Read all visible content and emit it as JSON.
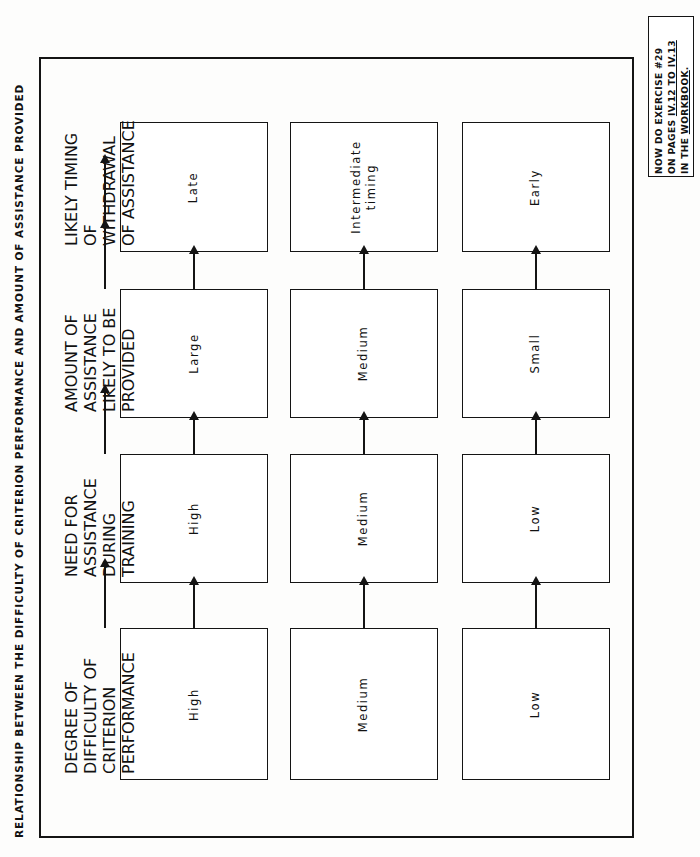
{
  "caption": {
    "text": "RELATIONSHIP BETWEEN THE DIFFICULTY OF CRITERION PERFORMANCE AND AMOUNT OF ASSISTANCE PROVIDED"
  },
  "note": {
    "line1": "NOW DO EXERCISE #29",
    "line2_plain": "ON PAGES ",
    "line2_underlined": "IV.12 TO IV.13",
    "line3_plain": "IN THE ",
    "line3_underlined": "WORKBOOK",
    "line3_tail": "."
  },
  "stage_headers": [
    {
      "id": "degree-of-difficulty",
      "text": "DEGREE OF\nDIFFICULTY\nOF CRITERION\nPERFORMANCE"
    },
    {
      "id": "need-for-assistance",
      "text": "NEED FOR\nASSISTANCE\nDURING\nTRAINING"
    },
    {
      "id": "amount-of-assistance",
      "text": "AMOUNT OF\nASSISTANCE\nLIKELY TO BE\nPROVIDED"
    },
    {
      "id": "likely-timing",
      "text": "LIKELY\nTIMING OF\nWITHDRAWAL\nOF ASSISTANCE"
    }
  ],
  "flows": [
    {
      "id": "flow-high",
      "nodes": [
        "High",
        "High",
        "Large",
        "Late"
      ]
    },
    {
      "id": "flow-medium",
      "nodes": [
        "Medium",
        "Medium",
        "Medium",
        "Intermediate\ntiming"
      ]
    },
    {
      "id": "flow-low",
      "nodes": [
        "Low",
        "Low",
        "Small",
        "Early"
      ]
    }
  ],
  "chart_data": {
    "type": "table",
    "title": "RELATIONSHIP BETWEEN THE DIFFICULTY OF CRITERION PERFORMANCE AND AMOUNT OF ASSISTANCE PROVIDED",
    "columns": [
      "DEGREE OF DIFFICULTY OF CRITERION PERFORMANCE",
      "NEED FOR ASSISTANCE DURING TRAINING",
      "AMOUNT OF ASSISTANCE LIKELY TO BE PROVIDED",
      "LIKELY TIMING OF WITHDRAWAL OF ASSISTANCE"
    ],
    "rows": [
      [
        "High",
        "High",
        "Large",
        "Late"
      ],
      [
        "Medium",
        "Medium",
        "Medium",
        "Intermediate timing"
      ],
      [
        "Low",
        "Low",
        "Small",
        "Early"
      ]
    ]
  }
}
